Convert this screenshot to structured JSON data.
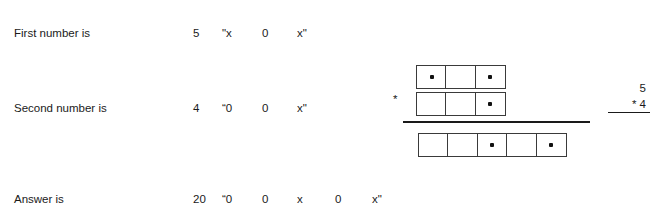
{
  "rows": [
    {
      "label": "First number is",
      "tokens": [
        "5",
        "\"x",
        "0",
        "x\""
      ]
    },
    {
      "label": "Second number is",
      "tokens": [
        "4",
        "“0",
        "0",
        "x\""
      ]
    },
    {
      "label": "Answer is",
      "tokens": [
        "20",
        "“0",
        "0",
        "x",
        "0",
        "x\""
      ]
    }
  ],
  "diagram": {
    "operator": "*",
    "rows": [
      {
        "name": "first-operand-row",
        "cells": [
          true,
          false,
          true
        ]
      },
      {
        "name": "second-operand-row",
        "cells": [
          false,
          false,
          true
        ]
      },
      {
        "name": "result-row",
        "cells": [
          false,
          false,
          true,
          false,
          true
        ]
      }
    ]
  },
  "calculation": {
    "operand_top": "5",
    "operand_bottom": "* 4"
  },
  "colors": {
    "background": "#ffffff",
    "text": "#1a1a1a",
    "cell_border": "#3a3a3a",
    "dot": "#111111"
  }
}
